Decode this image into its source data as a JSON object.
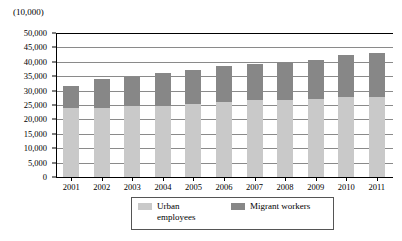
{
  "chart_data": {
    "type": "bar",
    "subtype": "stacked-bar",
    "title": "",
    "unit_label": "(10,000)",
    "xlabel": "",
    "ylabel": "",
    "categories": [
      "2001",
      "2002",
      "2003",
      "2004",
      "2005",
      "2006",
      "2007",
      "2008",
      "2009",
      "2010",
      "2011"
    ],
    "series": [
      {
        "name": "Urban employees",
        "color": "#c9c9c9",
        "values": [
          23900,
          24100,
          24500,
          24800,
          25400,
          25900,
          26600,
          26900,
          27100,
          27800,
          27900
        ]
      },
      {
        "name": "Migrant workers",
        "color": "#878787",
        "values": [
          7700,
          9900,
          10400,
          11400,
          11700,
          12600,
          12600,
          13000,
          13500,
          14400,
          15200
        ]
      }
    ],
    "totals": [
      31600,
      34000,
      34900,
      36200,
      37100,
      38500,
      39200,
      39900,
      40600,
      42200,
      43100
    ],
    "ylim": [
      0,
      50000
    ],
    "ytick_values": [
      0,
      5000,
      10000,
      15000,
      20000,
      25000,
      30000,
      35000,
      40000,
      45000,
      50000
    ],
    "ytick_labels": [
      "0",
      "5,000",
      "10,000",
      "15,000",
      "20,000",
      "25,000",
      "30,000",
      "35,000",
      "40,000",
      "45,000",
      "50,000"
    ],
    "grid": true,
    "legend_position": "bottom"
  },
  "legend": {
    "entries": [
      {
        "label": "Urban employees",
        "color": "#c9c9c9"
      },
      {
        "label": "Migrant workers",
        "color": "#878787"
      }
    ]
  }
}
